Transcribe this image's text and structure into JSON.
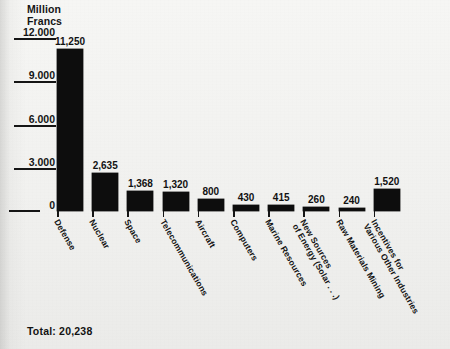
{
  "unit_caption": {
    "line1": "Million",
    "line2": "Francs"
  },
  "total_label": "Total: 20,238",
  "chart_data": {
    "type": "bar",
    "title": "",
    "subtitle": "",
    "xlabel": "",
    "ylabel": "Million Francs",
    "ylim": [
      0,
      12000
    ],
    "grid": false,
    "legend": "none",
    "orientation": "vertical",
    "bar_color": "#0d0d0d",
    "total": "20,238",
    "total_value": 20238,
    "ytick_labels": [
      "12.000",
      "9.000",
      "6.000",
      "3.000",
      "0"
    ],
    "ytick_values": [
      12000,
      9000,
      6000,
      3000,
      0
    ],
    "categories": [
      "Defense",
      "Nuclear",
      "Space",
      "Telecommunications",
      "Aircraft",
      "Computers",
      "Marine Resources",
      "New Sources\nof Energy (Solar . . .)",
      "Raw Materials Mining",
      "Incentives for\nVarious Other Industries"
    ],
    "values": [
      11250,
      2635,
      1368,
      1320,
      800,
      430,
      415,
      260,
      240,
      1520
    ],
    "value_labels": [
      "11,250",
      "2,635",
      "1,368",
      "1,320",
      "800",
      "430",
      "415",
      "260",
      "240",
      "1,520"
    ]
  }
}
